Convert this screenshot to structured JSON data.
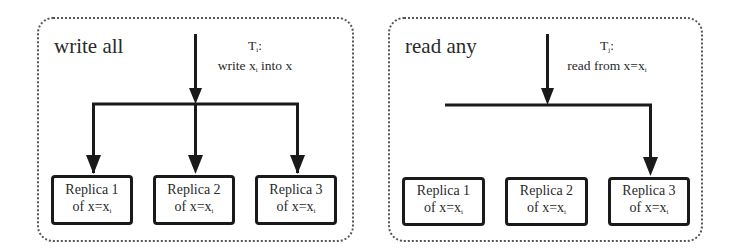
{
  "panels": [
    {
      "title": "write all",
      "transaction": {
        "name": "T",
        "sub": "i",
        "suffix": ":"
      },
      "action": {
        "prefix": "write x",
        "sub": "i",
        "suffix": " into x"
      },
      "replicas": [
        {
          "label": "Replica 1",
          "value_prefix": "of x=x",
          "value_sub": "i",
          "targeted": true
        },
        {
          "label": "Replica 2",
          "value_prefix": "of x=x",
          "value_sub": "i",
          "targeted": true
        },
        {
          "label": "Replica 3",
          "value_prefix": "of x=x",
          "value_sub": "i",
          "targeted": true
        }
      ]
    },
    {
      "title": "read any",
      "transaction": {
        "name": "T",
        "sub": "j",
        "suffix": ":"
      },
      "action": {
        "prefix": "read from x=x",
        "sub": "i",
        "suffix": ""
      },
      "replicas": [
        {
          "label": "Replica 1",
          "value_prefix": "of x=x",
          "value_sub": "i",
          "targeted": false
        },
        {
          "label": "Replica 2",
          "value_prefix": "of x=x",
          "value_sub": "i",
          "targeted": false
        },
        {
          "label": "Replica 3",
          "value_prefix": "of x=x",
          "value_sub": "i",
          "targeted": true
        }
      ]
    }
  ],
  "colors": {
    "line": "#1a1a1a",
    "border": "#555555",
    "text": "#2a2a2a"
  }
}
